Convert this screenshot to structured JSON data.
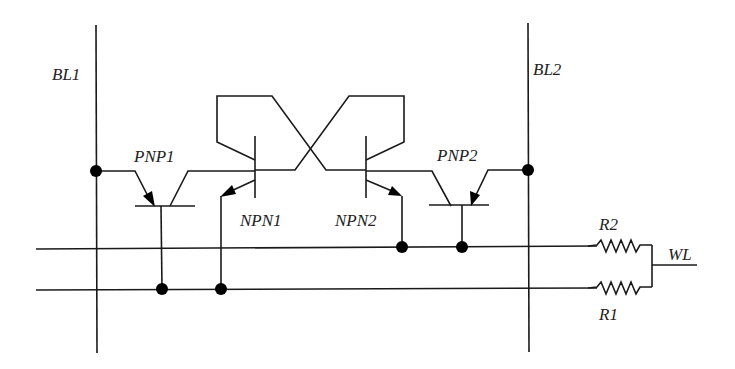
{
  "diagram": {
    "type": "circuit-schematic",
    "labels": {
      "bl1": "BL1",
      "bl2": "BL2",
      "pnp1": "PNP1",
      "pnp2": "PNP2",
      "npn1": "NPN1",
      "npn2": "NPN2",
      "r1": "R1",
      "r2": "R2",
      "wl": "WL"
    },
    "components": [
      {
        "id": "PNP1",
        "kind": "PNP transistor",
        "emitter": "BL1",
        "base": "lower line",
        "collector": "NPN1 base"
      },
      {
        "id": "PNP2",
        "kind": "PNP transistor",
        "emitter": "BL2",
        "base": "upper line",
        "collector": "NPN2 base"
      },
      {
        "id": "NPN1",
        "kind": "NPN transistor",
        "collector": "NPN2 base (cross-coupled)",
        "emitter": "lower line"
      },
      {
        "id": "NPN2",
        "kind": "NPN transistor",
        "collector": "NPN1 base (cross-coupled)",
        "emitter": "upper line"
      },
      {
        "id": "R1",
        "kind": "resistor",
        "between": "lower line and WL"
      },
      {
        "id": "R2",
        "kind": "resistor",
        "between": "upper line and WL"
      }
    ],
    "colors": {
      "wire": "#1a1a1a",
      "background": "#ffffff"
    }
  }
}
